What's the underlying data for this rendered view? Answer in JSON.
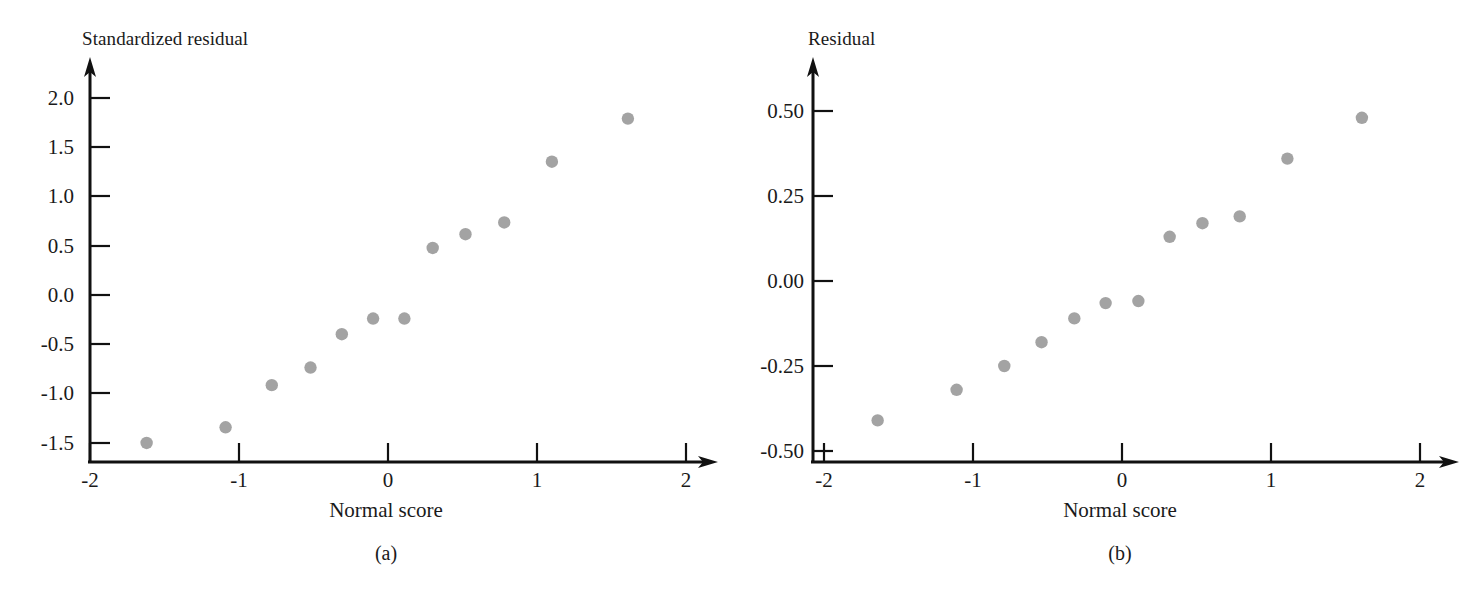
{
  "figure": {
    "width": 1481,
    "height": 589,
    "background": "#ffffff",
    "point_color": "#a3a3a3",
    "axis_color": "#111111"
  },
  "panels": [
    {
      "id": "a",
      "caption": "(a)",
      "y_axis_title": "Standardized residual",
      "x_axis_title": "Normal score",
      "x_ticks": [
        "-2",
        "-1",
        "0",
        "1",
        "2"
      ],
      "y_ticks": [
        "2.0",
        "1.5",
        "1.0",
        "0.5",
        "0.0",
        "-0.5",
        "-1.0",
        "-1.5"
      ],
      "chart_data": {
        "type": "scatter",
        "title": "",
        "xlabel": "Normal score",
        "ylabel": "Standardized residual",
        "xlim": [
          -2,
          2
        ],
        "ylim": [
          -1.75,
          2.2
        ],
        "xticks": [
          -2,
          -1,
          0,
          1,
          2
        ],
        "yticks": [
          2.0,
          1.5,
          1.0,
          0.5,
          0.0,
          -0.5,
          -1.0,
          -1.5
        ],
        "grid": false,
        "legend": "none",
        "x": [
          -1.62,
          -1.09,
          -0.78,
          -0.52,
          -0.31,
          -0.1,
          0.11,
          0.3,
          0.52,
          0.78,
          1.1,
          1.61
        ],
        "y": [
          -1.51,
          -1.35,
          -0.92,
          -0.74,
          -0.4,
          -0.24,
          -0.24,
          0.48,
          0.62,
          0.74,
          1.36,
          1.8
        ]
      }
    },
    {
      "id": "b",
      "caption": "(b)",
      "y_axis_title": "Residual",
      "x_axis_title": "Normal score",
      "x_ticks": [
        "-2",
        "-1",
        "0",
        "1",
        "2"
      ],
      "y_ticks": [
        "0.50",
        "0.25",
        "0.00",
        "-0.25",
        "-0.50"
      ],
      "chart_data": {
        "type": "scatter",
        "title": "",
        "xlabel": "Normal score",
        "ylabel": "Residual",
        "xlim": [
          -2,
          2
        ],
        "ylim": [
          -0.5,
          0.6
        ],
        "xticks": [
          -2,
          -1,
          0,
          1,
          2
        ],
        "yticks": [
          0.5,
          0.25,
          0.0,
          -0.25,
          -0.5
        ],
        "grid": false,
        "legend": "none",
        "x": [
          -1.64,
          -1.11,
          -0.79,
          -0.54,
          -0.32,
          -0.11,
          0.11,
          0.32,
          0.54,
          0.79,
          1.11,
          1.61
        ],
        "y": [
          -0.41,
          -0.32,
          -0.25,
          -0.18,
          -0.11,
          -0.065,
          -0.059,
          0.13,
          0.17,
          0.19,
          0.36,
          0.48
        ]
      }
    }
  ]
}
